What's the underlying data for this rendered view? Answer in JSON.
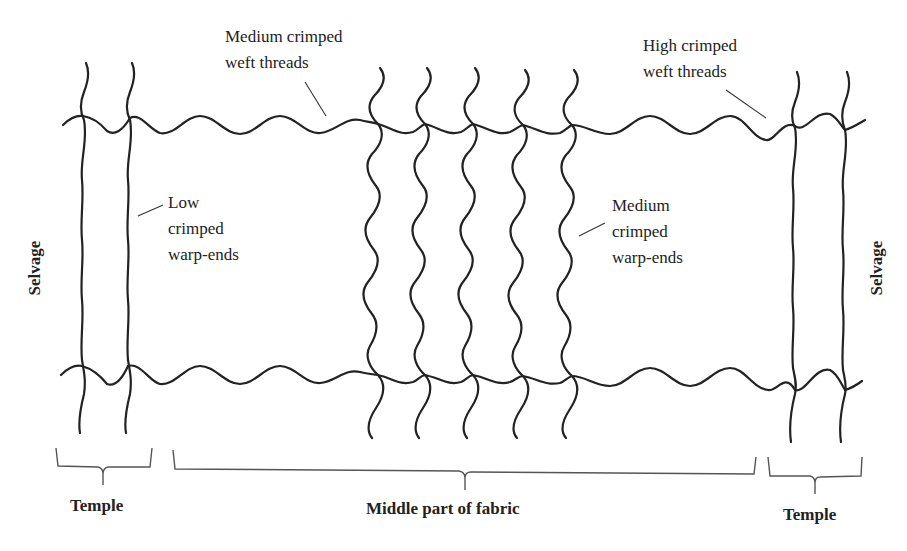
{
  "figure": {
    "labels": {
      "medium_weft": [
        "Medium crimped",
        "weft threads"
      ],
      "high_weft": [
        "High crimped",
        "weft threads"
      ],
      "low_warp": [
        "Low",
        "crimped",
        "warp-ends"
      ],
      "medium_warp": [
        "Medium",
        "crimped",
        "warp-ends"
      ],
      "selvage_left": "Selvage",
      "selvage_right": "Selvage",
      "temple_left": "Temple",
      "middle": "Middle part of fabric",
      "temple_right": "Temple"
    },
    "regions": [
      {
        "name": "Temple",
        "x_range": [
          56,
          152
        ]
      },
      {
        "name": "Middle part of fabric",
        "x_range": [
          173,
          755
        ]
      },
      {
        "name": "Temple",
        "x_range": [
          768,
          862
        ]
      }
    ],
    "warp_ends": [
      {
        "x": 83,
        "crimp": "low",
        "region": "left-temple"
      },
      {
        "x": 130,
        "crimp": "low",
        "region": "left-temple"
      },
      {
        "x": 378,
        "crimp": "medium",
        "region": "middle"
      },
      {
        "x": 425,
        "crimp": "medium",
        "region": "middle"
      },
      {
        "x": 473,
        "crimp": "medium",
        "region": "middle"
      },
      {
        "x": 523,
        "crimp": "medium",
        "region": "middle"
      },
      {
        "x": 572,
        "crimp": "medium",
        "region": "middle"
      },
      {
        "x": 795,
        "crimp": "low",
        "region": "right-temple"
      },
      {
        "x": 845,
        "crimp": "low",
        "region": "right-temple"
      }
    ],
    "weft_threads": [
      {
        "y": 128,
        "position": "top"
      },
      {
        "y": 378,
        "position": "bottom"
      }
    ],
    "colors": {
      "thread": "#222222",
      "brace": "#555555",
      "background": "#ffffff"
    }
  }
}
